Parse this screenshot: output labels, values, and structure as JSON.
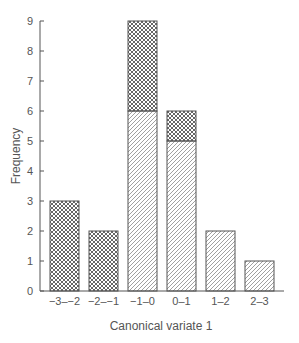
{
  "chart_data": {
    "type": "bar",
    "stacked": true,
    "title": "",
    "xlabel": "Canonical variate 1",
    "ylabel": "Frequency",
    "categories": [
      "−3–−2",
      "−2–−1",
      "−1–0",
      "0–1",
      "1–2",
      "2–3"
    ],
    "series": [
      {
        "name": "group A (diagonal hatch)",
        "pattern": "diagonal",
        "values": [
          0,
          0,
          6,
          5,
          2,
          1
        ]
      },
      {
        "name": "group B (cross hatch)",
        "pattern": "crosshatch",
        "values": [
          3,
          2,
          3,
          1,
          0,
          0
        ]
      }
    ],
    "totals": [
      3,
      2,
      9,
      6,
      2,
      1
    ],
    "ylim": [
      0,
      9
    ],
    "yticks": [
      0,
      1,
      2,
      3,
      4,
      5,
      6,
      7,
      8,
      9
    ],
    "grid": false,
    "legend": "none"
  },
  "colors": {
    "ink": "#555555",
    "background": "#ffffff"
  }
}
